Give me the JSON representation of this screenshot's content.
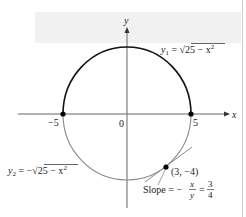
{
  "figure": {
    "axes": {
      "x_label": "x",
      "y_label": "y",
      "origin_label": "0",
      "left_tick": "−5",
      "right_tick": "5"
    },
    "curves": {
      "upper": {
        "name": "y1",
        "label_lhs": "y",
        "label_sub": "1",
        "label_rhs": " = √25 − x",
        "label_exp": "2",
        "color": "#111111"
      },
      "lower": {
        "name": "y2",
        "label_lhs": "y",
        "label_sub": "2",
        "label_rhs": " = −√25 − x",
        "label_exp": "2",
        "color": "#8a8a8a"
      }
    },
    "point": {
      "label": "(3, −4)"
    },
    "slope": {
      "prefix": "Slope = −",
      "frac1_num": "x",
      "frac1_den": "y",
      "equals": "=",
      "frac2_num": "3",
      "frac2_den": "4"
    },
    "colors": {
      "axis": "#666666",
      "panel": "#f1f1f1",
      "tangent": "#8a8a8a"
    }
  }
}
